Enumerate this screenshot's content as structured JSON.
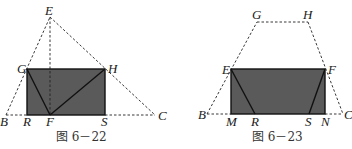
{
  "figures": [
    {
      "caption": "图 6－22",
      "points": {
        "E": "E",
        "G": "G",
        "H": "H",
        "B": "B",
        "R": "R",
        "F": "F",
        "S": "S",
        "C": "C"
      },
      "shaded_region": "rectangle GHSR",
      "solid_segments": [
        "GF",
        "FH"
      ],
      "dashed_segments": [
        "BE",
        "EC",
        "EF",
        "BR",
        "SC"
      ]
    },
    {
      "caption": "图 6－23",
      "points": {
        "G": "G",
        "H": "H",
        "E": "E",
        "F": "F",
        "B": "B",
        "M": "M",
        "R": "R",
        "S": "S",
        "N": "N",
        "C": "C"
      },
      "shaded_region": "rectangle EFNM",
      "solid_segments": [
        "ER",
        "FS"
      ],
      "dashed_segments": [
        "BG",
        "GH",
        "HC",
        "BM",
        "NC"
      ]
    }
  ],
  "colors": {
    "shade": "#5a5a5a",
    "line": "#111111",
    "background": "#ffffff"
  }
}
